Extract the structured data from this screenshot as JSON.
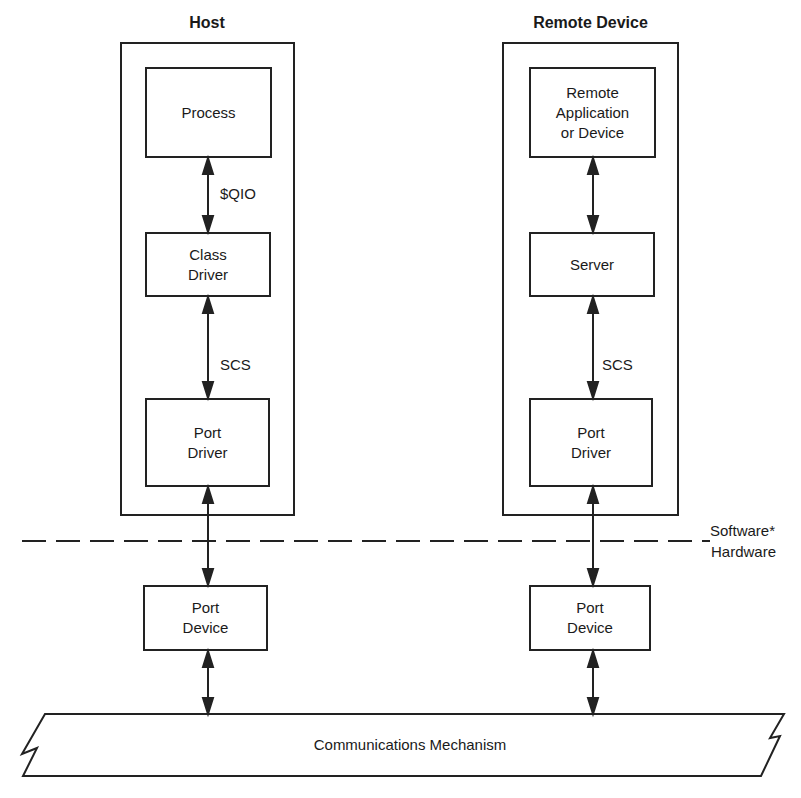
{
  "host": {
    "title": "Host",
    "process": "Process",
    "qio_label": "$QIO",
    "class_driver": "Class\nDriver",
    "scs_label": "SCS",
    "port_driver": "Port\nDriver",
    "port_device": "Port\nDevice"
  },
  "remote": {
    "title": "Remote Device",
    "application": "Remote\nApplication\nor Device",
    "server": "Server",
    "scs_label": "SCS",
    "port_driver": "Port\nDriver",
    "port_device": "Port\nDevice"
  },
  "boundary": {
    "software": "Software*",
    "hardware": "Hardware"
  },
  "bus": {
    "label": "Communications Mechanism"
  }
}
